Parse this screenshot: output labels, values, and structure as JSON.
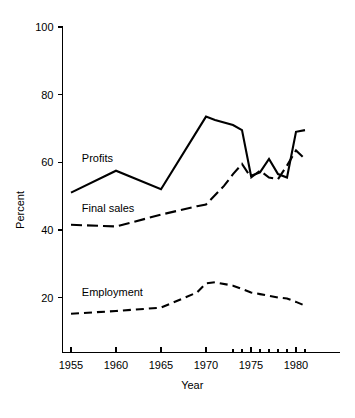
{
  "chart_data": {
    "type": "line",
    "title": "",
    "xlabel": "Year",
    "ylabel": "Percent",
    "xlim": [
      1954,
      1982
    ],
    "ylim": [
      0,
      100
    ],
    "grid": false,
    "legend_position": "inline-labels",
    "y_ticks": [
      20,
      40,
      60,
      80,
      100
    ],
    "y_tick_labels": [
      "20",
      "40",
      "60",
      "80",
      "100"
    ],
    "x_ticks_major": [
      1955,
      1960,
      1965,
      1970,
      1975,
      1980
    ],
    "x_tick_labels": [
      "1955",
      "1960",
      "1965",
      "1970",
      "1975",
      "1980"
    ],
    "x_ticks_minor": [
      1973,
      1974,
      1975,
      1976,
      1977,
      1978,
      1979,
      1980,
      1981
    ],
    "series": [
      {
        "name": "Profits",
        "line_style": "solid",
        "label_x": 1956.2,
        "label_y": 60.2,
        "x": [
          1955,
          1960,
          1965,
          1970,
          1971,
          1973,
          1974,
          1975,
          1976,
          1977,
          1978,
          1979,
          1980,
          1981
        ],
        "values": [
          51.0,
          57.5,
          52.0,
          73.5,
          72.5,
          71.0,
          69.5,
          56.0,
          57.0,
          61.0,
          56.5,
          55.5,
          69.0,
          69.5
        ]
      },
      {
        "name": "Final sales",
        "line_style": "dashed-long",
        "label_x": 1956.2,
        "label_y": 45.2,
        "x": [
          1955,
          1960,
          1965,
          1969,
          1970,
          1972,
          1973,
          1974,
          1975,
          1976,
          1977,
          1978,
          1979,
          1980,
          1981
        ],
        "values": [
          41.5,
          41.0,
          44.5,
          47.0,
          47.5,
          53.0,
          56.5,
          59.5,
          55.5,
          57.5,
          55.5,
          55.0,
          59.0,
          63.5,
          61.0
        ]
      },
      {
        "name": "Employment",
        "line_style": "dashed-short",
        "label_x": 1956.2,
        "label_y": 20.4,
        "x": [
          1955,
          1960,
          1965,
          1969,
          1970,
          1971,
          1973,
          1974,
          1975,
          1976,
          1977,
          1978,
          1979,
          1980,
          1981
        ],
        "values": [
          15.2,
          16.0,
          17.0,
          21.5,
          24.2,
          24.5,
          23.5,
          22.5,
          21.5,
          21.0,
          20.5,
          20.0,
          19.7,
          18.7,
          17.6
        ]
      }
    ]
  },
  "figure": {
    "background_color": "#ffffff",
    "ink_color": "#000000"
  }
}
